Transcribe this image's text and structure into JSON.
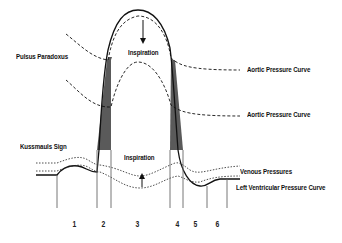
{
  "diagram": {
    "labels": {
      "pulsus_paradoxus": "Pulsus Paradoxus",
      "kussmauls_sign": "Kussmauls Sign",
      "inspiration_top": "Inspiration",
      "inspiration_bottom": "Inspiration",
      "aortic_pressure_curve_1": "Aortic Pressure Curve",
      "aortic_pressure_curve_2": "Aortic Pressure Curve",
      "venous_pressures": "Venous Pressures",
      "left_ventricular_pressure_curve": "Left Ventricular Pressure Curve"
    },
    "phases": [
      "1",
      "2",
      "3",
      "4",
      "5",
      "6"
    ],
    "arrows": {
      "top": "down-arrow",
      "bottom": "up-arrow"
    },
    "colors": {
      "line": "#111111",
      "shade": "#555555",
      "shade_dark": "#333333",
      "background": "#ffffff"
    }
  }
}
